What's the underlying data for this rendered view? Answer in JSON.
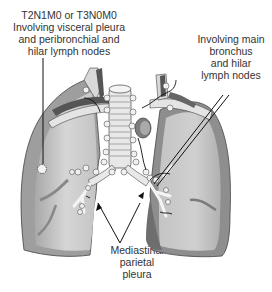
{
  "diagram": {
    "labels": {
      "left": {
        "lines": [
          "T2N1M0 or T3N0M0",
          "Involving visceral pleura",
          "and peribronchial and",
          "hilar lymph nodes"
        ]
      },
      "right": {
        "lines": [
          "Involving main",
          "bronchus",
          "and hilar",
          "lymph nodes"
        ]
      },
      "bottom": {
        "lines": [
          "Mediastinal",
          "parietal",
          "pleura"
        ]
      }
    },
    "colors": {
      "lung_fill": "#c8c8c8",
      "lung_outer": "#9a9a9a",
      "lung_dark": "#7a7a7a",
      "vessel": "#e8e8e8",
      "vessel_dark": "#555555",
      "node": "#f0f0f0",
      "line": "#111111",
      "text": "#333333"
    }
  }
}
